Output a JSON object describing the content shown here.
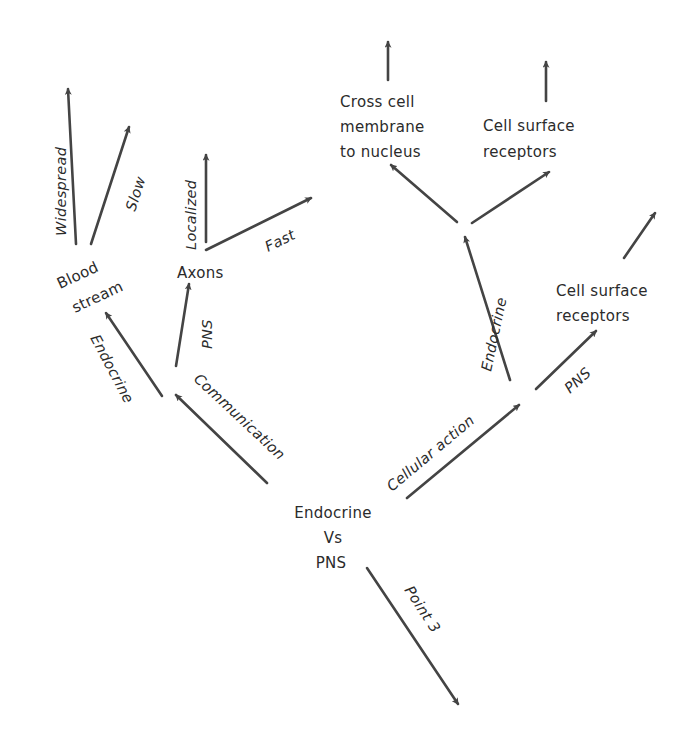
{
  "diagram": {
    "type": "mind-map",
    "stroke_color": "#444444",
    "text_color": "#2b2b2b",
    "background": "#ffffff",
    "center": {
      "lines": [
        "Endocrine",
        "Vs",
        "PNS"
      ]
    },
    "nodes": {
      "blood_stream": [
        "Blood",
        "stream"
      ],
      "axons": "Axons",
      "cross_cell": [
        "Cross cell",
        "membrane",
        "to nucleus"
      ],
      "cell_surface_top": [
        "Cell surface",
        "receptors"
      ],
      "cell_surface_right": [
        "Cell surface",
        "receptors"
      ]
    },
    "edge_labels": {
      "communication": "Communication",
      "cellular_action": "Cellular action",
      "point3": "Point 3",
      "endocrine_left": "Endocrine",
      "pns_left": "PNS",
      "widespread": "Widespread",
      "slow": "Slow",
      "localized": "Localized",
      "fast": "Fast",
      "endocrine_right": "Endocrine",
      "pns_right": "PNS"
    },
    "edges": [
      {
        "from": "center",
        "to": "communication-hub",
        "label": "Communication"
      },
      {
        "from": "communication-hub",
        "to": "blood_stream",
        "label": "Endocrine"
      },
      {
        "from": "communication-hub",
        "to": "axons",
        "label": "PNS"
      },
      {
        "from": "blood_stream",
        "to": "widespread-leaf",
        "label": "Widespread"
      },
      {
        "from": "blood_stream",
        "to": "slow-leaf",
        "label": "Slow"
      },
      {
        "from": "axons",
        "to": "localized-leaf",
        "label": "Localized"
      },
      {
        "from": "axons",
        "to": "fast-leaf",
        "label": "Fast"
      },
      {
        "from": "center",
        "to": "cellular-action-hub",
        "label": "Cellular action"
      },
      {
        "from": "cellular-action-hub",
        "to": "endocrine-hub",
        "label": "Endocrine"
      },
      {
        "from": "cellular-action-hub",
        "to": "cell_surface_right",
        "label": "PNS"
      },
      {
        "from": "endocrine-hub",
        "to": "cross_cell",
        "label": ""
      },
      {
        "from": "endocrine-hub",
        "to": "cell_surface_top",
        "label": ""
      },
      {
        "from": "center",
        "to": "point3-leaf",
        "label": "Point 3"
      }
    ]
  }
}
